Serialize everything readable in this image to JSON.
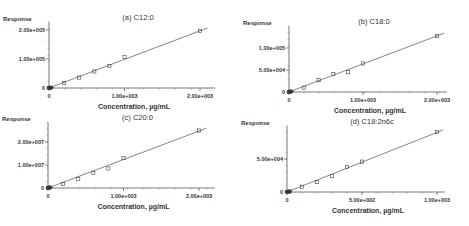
{
  "chart_data": [
    {
      "type": "scatter",
      "title": "(a) C12:0",
      "xlabel": "Concentration, µg/mL",
      "ylabel": "Response",
      "xticks": [
        {
          "v": 0,
          "label": "0"
        },
        {
          "v": 1000,
          "label": "1.00e+003"
        },
        {
          "v": 2000,
          "label": "2.00e+003"
        }
      ],
      "yticks": [
        {
          "v": 0,
          "label": "0"
        },
        {
          "v": 100000,
          "label": "1.00e+005"
        },
        {
          "v": 200000,
          "label": "2.00e+005"
        }
      ],
      "xlim": [
        0,
        2100
      ],
      "ylim": [
        0,
        200000
      ],
      "fit_line": {
        "x0": 0,
        "y0": 0,
        "x1": 2100,
        "y1": 207000
      },
      "points": [
        [
          0,
          0
        ],
        [
          5,
          300
        ],
        [
          10,
          700
        ],
        [
          20,
          1500
        ],
        [
          200,
          17000
        ],
        [
          400,
          36000
        ],
        [
          600,
          57000
        ],
        [
          800,
          76000
        ],
        [
          1000,
          107000
        ],
        [
          2000,
          197000
        ]
      ],
      "frame": {
        "x0": 49,
        "y0": 88,
        "xpx_per": 0.0755,
        "ypx_per": 0.00029,
        "xend": 215,
        "ytop": 28
      }
    },
    {
      "type": "scatter",
      "title": "(b) C18:0",
      "xlabel": "Concentration, µg/mL",
      "ylabel": "Response",
      "xticks": [
        {
          "v": 0,
          "label": "0"
        },
        {
          "v": 1000,
          "label": "1.00e+003"
        },
        {
          "v": 2000,
          "label": "2.00e+003"
        }
      ],
      "yticks": [
        {
          "v": 0,
          "label": "0"
        },
        {
          "v": 50000,
          "label": "5.00e+004"
        },
        {
          "v": 100000,
          "label": "1.00e+005"
        }
      ],
      "xlim": [
        0,
        2100
      ],
      "ylim": [
        0,
        140000
      ],
      "fit_line": {
        "x0": 0,
        "y0": 0,
        "x1": 2100,
        "y1": 134000
      },
      "points": [
        [
          0,
          0
        ],
        [
          5,
          300
        ],
        [
          10,
          600
        ],
        [
          20,
          1300
        ],
        [
          200,
          10000
        ],
        [
          400,
          27000
        ],
        [
          600,
          41000
        ],
        [
          800,
          45000
        ],
        [
          1000,
          65000
        ],
        [
          2000,
          127000
        ]
      ],
      "frame": {
        "x0": 289,
        "y0": 92,
        "xpx_per": 0.074,
        "ypx_per": 0.00044,
        "xend": 447,
        "ytop": 32
      }
    },
    {
      "type": "scatter",
      "title": "(c) C20:0",
      "xlabel": "Concentration, µg/mL",
      "ylabel": "Response",
      "xticks": [
        {
          "v": 0,
          "label": "0"
        },
        {
          "v": 1000,
          "label": "1.00e+003"
        },
        {
          "v": 2000,
          "label": "2.00e+003"
        }
      ],
      "yticks": [
        {
          "v": 0,
          "label": "0"
        },
        {
          "v": 10000000,
          "label": "1.00e+007"
        },
        {
          "v": 20000000,
          "label": "2.00e+007"
        }
      ],
      "xlim": [
        0,
        2100
      ],
      "ylim": [
        0,
        26000000
      ],
      "fit_line": {
        "x0": 0,
        "y0": 0,
        "x1": 2100,
        "y1": 26000000
      },
      "points": [
        [
          0,
          0
        ],
        [
          5,
          60000
        ],
        [
          10,
          120000
        ],
        [
          20,
          300000
        ],
        [
          200,
          1800000
        ],
        [
          400,
          4000000
        ],
        [
          600,
          6500000
        ],
        [
          800,
          8500000
        ],
        [
          1000,
          13000000
        ],
        [
          2000,
          25000000
        ]
      ],
      "frame": {
        "x0": 48,
        "y0": 188,
        "xpx_per": 0.0755,
        "ypx_per": 2.3e-06,
        "xend": 215,
        "ytop": 128
      }
    },
    {
      "type": "scatter",
      "title": "(d) C18:2n6c",
      "xlabel": "Concentration, µg/mL",
      "ylabel": "Response",
      "xticks": [
        {
          "v": 0,
          "label": "0"
        },
        {
          "v": 500,
          "label": "5.00e+002"
        },
        {
          "v": 1000,
          "label": "1.00e+003"
        }
      ],
      "yticks": [
        {
          "v": 0,
          "label": "0"
        },
        {
          "v": 50000,
          "label": "5.00e+004"
        }
      ],
      "xlim": [
        0,
        1050
      ],
      "ylim": [
        0,
        100000
      ],
      "fit_line": {
        "x0": 0,
        "y0": 0,
        "x1": 1040,
        "y1": 94000
      },
      "points": [
        [
          0,
          0
        ],
        [
          5,
          200
        ],
        [
          10,
          500
        ],
        [
          20,
          1000
        ],
        [
          100,
          8000
        ],
        [
          200,
          15000
        ],
        [
          300,
          24000
        ],
        [
          400,
          38000
        ],
        [
          500,
          46000
        ],
        [
          1000,
          91000
        ]
      ],
      "frame": {
        "x0": 287,
        "y0": 192,
        "xpx_per": 0.15,
        "ypx_per": 0.00066,
        "xend": 445,
        "ytop": 132
      }
    }
  ]
}
